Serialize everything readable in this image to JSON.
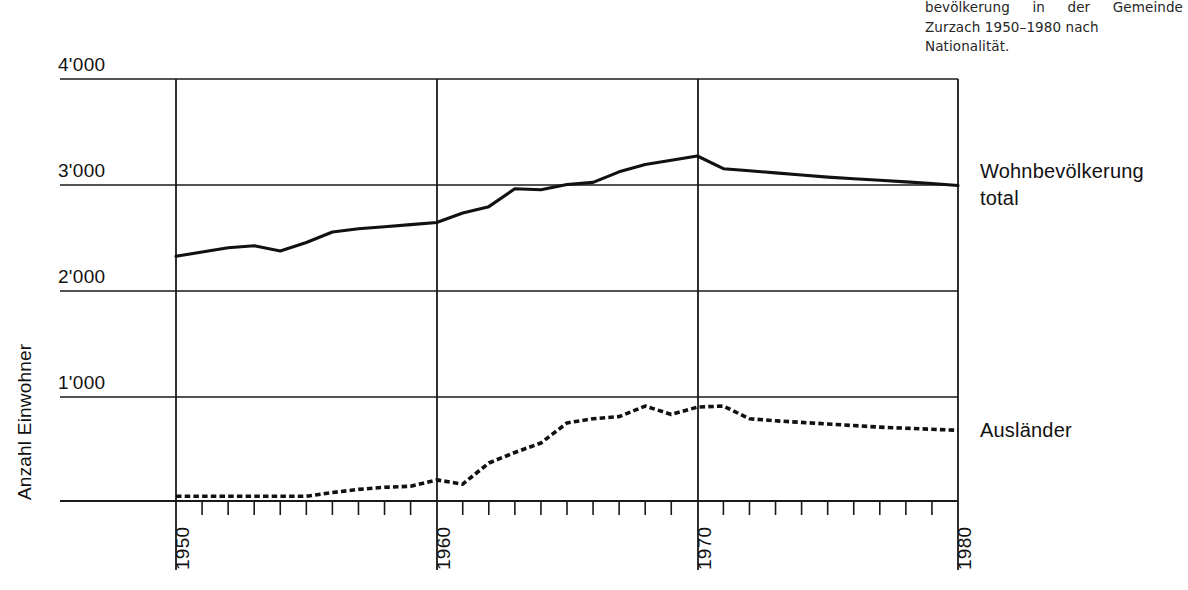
{
  "caption": {
    "lines": [
      "bevölkerung in der Gemeinde",
      "Zurzach 1950–1980 nach",
      "Nationalität."
    ]
  },
  "axes": {
    "y_title": "Anzahl Einwohner",
    "y_ticks": [
      "4'000",
      "3'000",
      "2'000",
      "1'000"
    ],
    "x_ticks": [
      "1950",
      "1960",
      "1970",
      "1980"
    ]
  },
  "series_labels": {
    "total_line1": "Wohnbevölkerung",
    "total_line2": "total",
    "foreign": "Ausländer"
  },
  "colors": {
    "line": "#111111",
    "grid": "#1a1a1a",
    "background": "#ffffff",
    "text": "#111111",
    "caption_text": "#262626"
  },
  "chart_data": {
    "type": "line",
    "title": "",
    "subtitle": "",
    "xlabel": "",
    "ylabel": "Anzahl Einwohner",
    "xlim": [
      1950,
      1980
    ],
    "ylim": [
      0,
      4000
    ],
    "yticks": [
      1000,
      2000,
      3000,
      4000
    ],
    "ytick_labels": [
      "1'000",
      "2'000",
      "3'000",
      "4'000"
    ],
    "xticks": [
      1950,
      1960,
      1970,
      1980
    ],
    "xtick_labels": [
      "1950",
      "1960",
      "1970",
      "1980"
    ],
    "minor_xticks_every": 1,
    "grid": "horizontal-and-major-vertical",
    "legend": "right-of-plot-inline",
    "x": [
      1950,
      1951,
      1952,
      1953,
      1954,
      1955,
      1956,
      1957,
      1958,
      1959,
      1960,
      1961,
      1962,
      1963,
      1964,
      1965,
      1966,
      1967,
      1968,
      1969,
      1970,
      1971,
      1972,
      1973,
      1974,
      1975,
      1976,
      1977,
      1978,
      1979,
      1980
    ],
    "series": [
      {
        "name": "Wohnbevölkerung total",
        "style": "solid",
        "values": [
          2320,
          2360,
          2400,
          2420,
          2370,
          2450,
          2550,
          2580,
          2600,
          2620,
          2640,
          2730,
          2790,
          2960,
          2950,
          3000,
          3020,
          3120,
          3190,
          3230,
          3270,
          3150,
          3130,
          3110,
          3090,
          3070,
          3055,
          3040,
          3025,
          3010,
          2990
        ]
      },
      {
        "name": "Ausländer",
        "style": "dotted",
        "values": [
          45,
          45,
          45,
          45,
          45,
          45,
          80,
          110,
          130,
          140,
          200,
          160,
          360,
          460,
          550,
          740,
          780,
          800,
          900,
          820,
          890,
          900,
          780,
          760,
          745,
          730,
          715,
          700,
          690,
          680,
          670
        ]
      }
    ]
  }
}
